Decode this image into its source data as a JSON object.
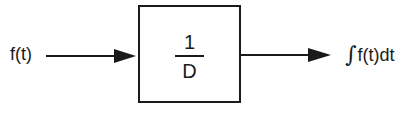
{
  "diagram": {
    "type": "block-diagram",
    "input": {
      "label": "f(t)"
    },
    "block": {
      "numerator": "1",
      "denominator": "D",
      "operator": "integrator"
    },
    "output": {
      "integral_symbol": "∫",
      "label": "f(t)dt"
    },
    "edges": [
      {
        "from": "input",
        "to": "block"
      },
      {
        "from": "block",
        "to": "output"
      }
    ],
    "colors": {
      "stroke": "#1a1a1a",
      "background": "#ffffff"
    }
  }
}
